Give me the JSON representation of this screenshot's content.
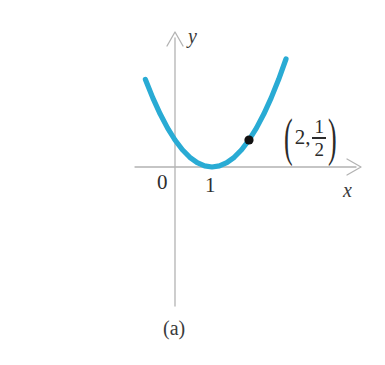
{
  "figure": {
    "caption": "(a)",
    "background_color": "#ffffff",
    "curve_color": "#29abd4",
    "axis_color": "#b3b3b3",
    "point_color": "#111111",
    "text_color": "#2b2b2b"
  },
  "axes": {
    "x_label": "x",
    "y_label": "y",
    "x_axis_name": "x-axis",
    "y_axis_name": "y-axis",
    "tick_labels": [
      {
        "text": "0",
        "axis": "origin"
      },
      {
        "text": "1",
        "axis": "x"
      }
    ]
  },
  "annotation": {
    "open_paren": "(",
    "close_paren": ")",
    "x_value": "2",
    "comma": ",",
    "numerator": "1",
    "denominator": "2",
    "full_text": "(2, 1/2)"
  },
  "chart_data": {
    "type": "line",
    "title": "",
    "subtitle": "",
    "xlabel": "x",
    "ylabel": "y",
    "grid": false,
    "legend": null,
    "caption": "(a)",
    "function": "y = (1/2)(x - 1)^2",
    "vertex": [
      1,
      0
    ],
    "xlim": [
      -0.8,
      3.1
    ],
    "ylim": [
      -0.35,
      2.3
    ],
    "series": [
      {
        "name": "parabola",
        "color": "#29abd4",
        "x": [
          -0.8,
          -0.6,
          -0.4,
          -0.2,
          0.0,
          0.2,
          0.4,
          0.6,
          0.8,
          1.0,
          1.2,
          1.4,
          1.6,
          1.8,
          2.0,
          2.2,
          2.4,
          2.6,
          2.8,
          3.0
        ],
        "y": [
          1.62,
          1.28,
          0.98,
          0.72,
          0.5,
          0.32,
          0.18,
          0.08,
          0.02,
          0.0,
          0.02,
          0.08,
          0.18,
          0.32,
          0.5,
          0.72,
          0.98,
          1.28,
          1.62,
          2.0
        ]
      }
    ],
    "points": [
      {
        "name": "marked-point",
        "x": 2,
        "y": 0.5,
        "label": "(2, 1/2)",
        "color": "#111111"
      }
    ],
    "xticks": [
      0,
      1
    ],
    "xticklabels": [
      "0",
      "1"
    ],
    "yticks": [],
    "yticklabels": []
  }
}
